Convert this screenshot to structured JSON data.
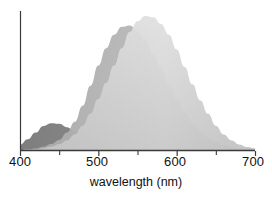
{
  "chart_data": {
    "type": "area",
    "title": "",
    "subtitle": "",
    "xlabel": "wavelength (nm)",
    "ylabel": "",
    "xlim": [
      400,
      700
    ],
    "ylim": [
      0,
      1
    ],
    "grid": false,
    "legend_position": "none",
    "xticks": [
      400,
      500,
      600,
      700
    ],
    "xtick_labels": [
      "400",
      "500",
      "600",
      "700"
    ],
    "xminor_ticks": [
      450,
      550,
      650
    ],
    "yticks": [],
    "ytick_labels": [],
    "x": [
      400,
      410,
      420,
      430,
      440,
      450,
      460,
      470,
      480,
      490,
      500,
      510,
      520,
      530,
      540,
      550,
      560,
      570,
      580,
      590,
      600,
      610,
      620,
      630,
      640,
      650,
      660,
      670,
      680,
      690,
      700
    ],
    "series": [
      {
        "name": "S-cone response",
        "peak_nm": 442,
        "peak_value": 0.2,
        "fill_color": "#8c8c8c",
        "values": [
          0.04,
          0.08,
          0.13,
          0.18,
          0.2,
          0.195,
          0.17,
          0.14,
          0.105,
          0.075,
          0.05,
          0.032,
          0.02,
          0.012,
          0.007,
          0.004,
          0.002,
          0.001,
          0.0,
          0.0,
          0.0,
          0.0,
          0.0,
          0.0,
          0.0,
          0.0,
          0.0,
          0.0,
          0.0,
          0.0,
          0.0
        ]
      },
      {
        "name": "M-cone response",
        "peak_nm": 534,
        "peak_value": 0.93,
        "fill_color": "#b3b3b3",
        "values": [
          0.0,
          0.005,
          0.012,
          0.025,
          0.045,
          0.075,
          0.13,
          0.21,
          0.33,
          0.48,
          0.63,
          0.76,
          0.86,
          0.92,
          0.93,
          0.89,
          0.82,
          0.72,
          0.61,
          0.49,
          0.38,
          0.28,
          0.2,
          0.14,
          0.095,
          0.062,
          0.038,
          0.022,
          0.012,
          0.006,
          0.003
        ]
      },
      {
        "name": "L-cone response",
        "peak_nm": 566,
        "peak_value": 1.0,
        "fill_color": "#cfcfcf",
        "values": [
          0.0,
          0.002,
          0.006,
          0.012,
          0.024,
          0.042,
          0.07,
          0.115,
          0.18,
          0.27,
          0.38,
          0.5,
          0.63,
          0.76,
          0.88,
          0.96,
          1.0,
          0.99,
          0.94,
          0.86,
          0.75,
          0.62,
          0.49,
          0.37,
          0.27,
          0.18,
          0.115,
          0.07,
          0.04,
          0.022,
          0.012
        ]
      }
    ],
    "axis_color": "#3a3a3a"
  }
}
